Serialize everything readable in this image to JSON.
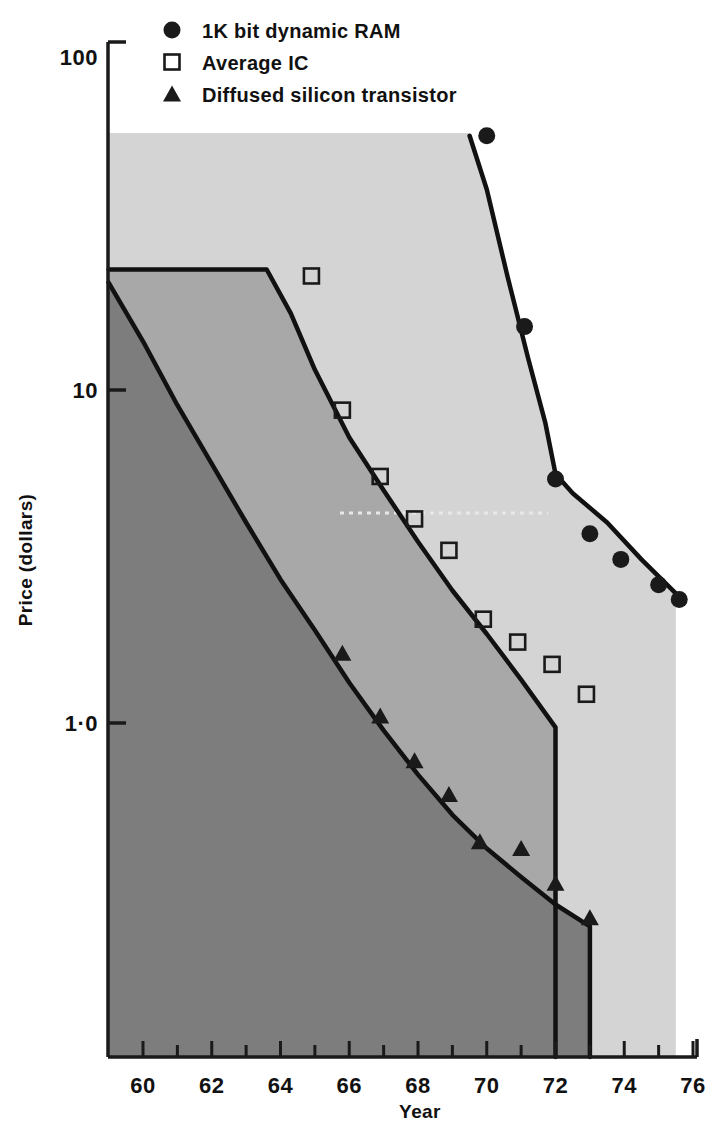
{
  "chart_data": {
    "type": "scatter",
    "title": "",
    "xlabel": "Year",
    "ylabel": "Price (dollars)",
    "yscale": "log",
    "ylim": [
      0.1,
      100
    ],
    "xlim": [
      1959,
      1976
    ],
    "grid": false,
    "legend_position": "top-right",
    "y_ticks": [
      {
        "value": 100,
        "label": "100"
      },
      {
        "value": 10,
        "label": "10"
      },
      {
        "value": 1,
        "label": "1·0"
      }
    ],
    "x_ticks": [
      {
        "value": 1960,
        "label": "60"
      },
      {
        "value": 1961,
        "label": ""
      },
      {
        "value": 1962,
        "label": "62"
      },
      {
        "value": 1963,
        "label": ""
      },
      {
        "value": 1964,
        "label": "64"
      },
      {
        "value": 1965,
        "label": ""
      },
      {
        "value": 1966,
        "label": "66"
      },
      {
        "value": 1967,
        "label": ""
      },
      {
        "value": 1968,
        "label": "68"
      },
      {
        "value": 1969,
        "label": ""
      },
      {
        "value": 1970,
        "label": "70"
      },
      {
        "value": 1971,
        "label": ""
      },
      {
        "value": 1972,
        "label": "72"
      },
      {
        "value": 1973,
        "label": ""
      },
      {
        "value": 1974,
        "label": "74"
      },
      {
        "value": 1975,
        "label": ""
      },
      {
        "value": 1976,
        "label": "76"
      }
    ],
    "series": [
      {
        "name": "1K bit dynamic RAM",
        "marker": "filled-circle",
        "color": "#1a1a1a",
        "band_fill": "#d4d4d4",
        "points": [
          {
            "x": 1970.0,
            "y": 58
          },
          {
            "x": 1971.1,
            "y": 15.5
          },
          {
            "x": 1972.0,
            "y": 5.4
          },
          {
            "x": 1973.0,
            "y": 3.7
          },
          {
            "x": 1973.9,
            "y": 3.1
          },
          {
            "x": 1975.0,
            "y": 2.6
          },
          {
            "x": 1975.6,
            "y": 2.35
          }
        ],
        "band_curve": [
          {
            "x": 1969.5,
            "y": 58
          },
          {
            "x": 1970.0,
            "y": 40
          },
          {
            "x": 1970.6,
            "y": 22
          },
          {
            "x": 1971.2,
            "y": 12.5
          },
          {
            "x": 1971.7,
            "y": 8.0
          },
          {
            "x": 1972.0,
            "y": 5.6
          },
          {
            "x": 1972.5,
            "y": 4.9
          },
          {
            "x": 1973.5,
            "y": 4.0
          },
          {
            "x": 1974.5,
            "y": 3.1
          },
          {
            "x": 1975.5,
            "y": 2.45
          }
        ]
      },
      {
        "name": "Average IC",
        "marker": "open-square",
        "color": "#1a1a1a",
        "band_fill": "#a8a8a8",
        "points": [
          {
            "x": 1964.9,
            "y": 22
          },
          {
            "x": 1965.8,
            "y": 8.7
          },
          {
            "x": 1966.9,
            "y": 5.5
          },
          {
            "x": 1967.9,
            "y": 4.1
          },
          {
            "x": 1968.9,
            "y": 3.3
          },
          {
            "x": 1969.9,
            "y": 2.05
          },
          {
            "x": 1970.9,
            "y": 1.75
          },
          {
            "x": 1971.9,
            "y": 1.5
          },
          {
            "x": 1972.9,
            "y": 1.22
          }
        ],
        "band_curve": [
          {
            "x": 1959.0,
            "y": 23
          },
          {
            "x": 1963.6,
            "y": 23
          },
          {
            "x": 1964.3,
            "y": 17
          },
          {
            "x": 1965.0,
            "y": 11.5
          },
          {
            "x": 1966.0,
            "y": 7.2
          },
          {
            "x": 1967.0,
            "y": 5.0
          },
          {
            "x": 1968.0,
            "y": 3.5
          },
          {
            "x": 1969.0,
            "y": 2.5
          },
          {
            "x": 1970.0,
            "y": 1.85
          },
          {
            "x": 1971.0,
            "y": 1.35
          },
          {
            "x": 1972.0,
            "y": 0.97
          }
        ]
      },
      {
        "name": "Diffused silicon transistor",
        "marker": "filled-triangle",
        "color": "#1a1a1a",
        "band_fill": "#7d7d7d",
        "points": [
          {
            "x": 1965.8,
            "y": 1.62
          },
          {
            "x": 1966.9,
            "y": 1.05
          },
          {
            "x": 1967.9,
            "y": 0.77
          },
          {
            "x": 1968.9,
            "y": 0.61
          },
          {
            "x": 1969.8,
            "y": 0.44
          },
          {
            "x": 1971.0,
            "y": 0.42
          },
          {
            "x": 1972.0,
            "y": 0.33
          },
          {
            "x": 1973.0,
            "y": 0.26
          }
        ],
        "band_curve": [
          {
            "x": 1959.0,
            "y": 21
          },
          {
            "x": 1960.0,
            "y": 14
          },
          {
            "x": 1961.0,
            "y": 9.0
          },
          {
            "x": 1962.0,
            "y": 6.0
          },
          {
            "x": 1963.0,
            "y": 4.0
          },
          {
            "x": 1964.0,
            "y": 2.7
          },
          {
            "x": 1965.0,
            "y": 1.9
          },
          {
            "x": 1966.0,
            "y": 1.32
          },
          {
            "x": 1967.0,
            "y": 0.95
          },
          {
            "x": 1968.0,
            "y": 0.7
          },
          {
            "x": 1969.0,
            "y": 0.53
          },
          {
            "x": 1970.0,
            "y": 0.42
          },
          {
            "x": 1971.0,
            "y": 0.345
          },
          {
            "x": 1972.0,
            "y": 0.285
          },
          {
            "x": 1973.0,
            "y": 0.245
          }
        ]
      }
    ],
    "annotations": []
  },
  "legend": {
    "items": [
      {
        "marker": "filled-circle",
        "label": "1K bit dynamic RAM"
      },
      {
        "marker": "open-square",
        "label": "Average IC"
      },
      {
        "marker": "filled-triangle",
        "label": "Diffused silicon transistor"
      }
    ]
  },
  "colors": {
    "axis": "#1a1a1a",
    "curve": "#111111",
    "band_ram": "#d4d4d4",
    "band_ic": "#a8a8a8",
    "band_transistor": "#7d7d7d",
    "background": "#ffffff"
  }
}
